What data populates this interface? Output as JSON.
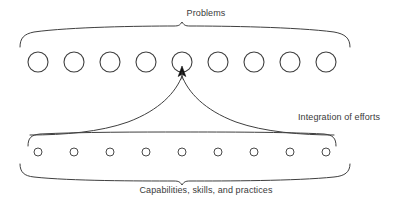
{
  "diagram": {
    "title_label": "Problems",
    "middle_label": "Integration of efforts",
    "bottom_label": "Capabilities, skills, and practices",
    "colors": {
      "background": "#ffffff",
      "stroke": "#3f3f3f",
      "text": "#3a3a3a",
      "arrow": "#111111"
    },
    "top_row": {
      "name": "problems-row",
      "count": 9,
      "circle_diameter_px": 20,
      "center_y_px": 62,
      "centers_x_px": [
        38,
        74,
        110,
        146,
        182,
        218,
        254,
        290,
        326
      ]
    },
    "bottom_row": {
      "name": "capabilities-row",
      "count": 9,
      "circle_diameter_px": 8,
      "center_y_px": 152,
      "centers_x_px": [
        38,
        74,
        110,
        146,
        182,
        218,
        254,
        290,
        326
      ]
    },
    "top_brace": {
      "left_x_px": 20,
      "right_x_px": 350,
      "peak_x_px": 182,
      "peak_y_px": 28,
      "direction": "up"
    },
    "middle_brace": {
      "left_x_px": 28,
      "right_x_px": 336,
      "y_px": 134,
      "direction": "up"
    },
    "bottom_brace": {
      "left_x_px": 20,
      "right_x_px": 350,
      "peak_x_px": 182,
      "peak_y_px": 179,
      "direction": "down"
    },
    "arrow": {
      "name": "integration-arrow",
      "tip_x_px": 182,
      "tip_y_px": 68,
      "description": "arrow pointing up into fifth problem circle"
    }
  }
}
